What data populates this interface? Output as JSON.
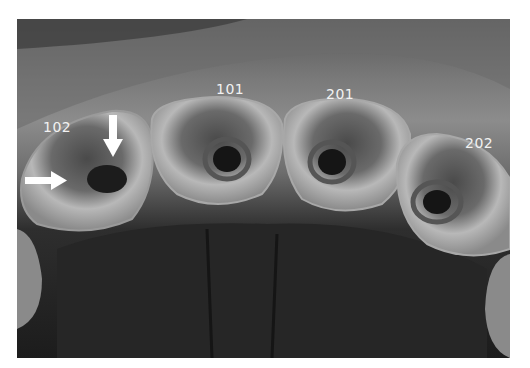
{
  "figure": {
    "tooth_labels": [
      {
        "id": "102",
        "text": "102"
      },
      {
        "id": "101",
        "text": "101"
      },
      {
        "id": "201",
        "text": "201"
      },
      {
        "id": "202",
        "text": "202"
      }
    ],
    "arrows": [
      {
        "name": "arrow-down",
        "direction": "down",
        "target": "102"
      },
      {
        "name": "arrow-right",
        "direction": "right",
        "target": "102"
      }
    ],
    "colors": {
      "background": "#ffffff",
      "label": "#f2f2f2",
      "arrow": "#ffffff"
    }
  }
}
